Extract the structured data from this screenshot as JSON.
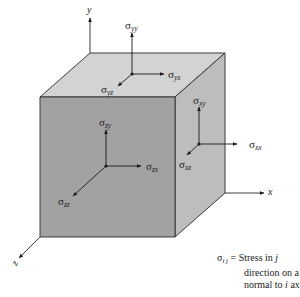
{
  "diagram": {
    "type": "3d-stress-element-cube",
    "colors": {
      "top_face": "#d3d3d3",
      "front_face": "#a2a2a2",
      "right_face": "#bdbdbd",
      "edge": "#2a2a2a",
      "arrow": "#1a1a1a"
    },
    "axes": {
      "x": {
        "label": "x"
      },
      "y": {
        "label": "y"
      },
      "z": {
        "label": "z"
      }
    },
    "faces": {
      "top": {
        "normal_axis": "y",
        "stresses": [
          {
            "symbol": "σ",
            "sub": "yy",
            "direction": "up"
          },
          {
            "symbol": "σ",
            "sub": "yx",
            "direction": "right"
          },
          {
            "symbol": "σ",
            "sub": "yz",
            "direction": "down-left"
          }
        ]
      },
      "front": {
        "normal_axis": "z",
        "stresses": [
          {
            "symbol": "σ",
            "sub": "zy",
            "direction": "up"
          },
          {
            "symbol": "σ",
            "sub": "zx",
            "direction": "right"
          },
          {
            "symbol": "σ",
            "sub": "zz",
            "direction": "down-left"
          }
        ]
      },
      "right": {
        "normal_axis": "x",
        "stresses": [
          {
            "symbol": "σ",
            "sub": "xy",
            "direction": "up"
          },
          {
            "symbol": "σ",
            "sub": "xx",
            "direction": "right"
          },
          {
            "symbol": "σ",
            "sub": "xz",
            "direction": "down-left"
          }
        ]
      }
    },
    "legend": {
      "symbol": "σ",
      "sub": "i j",
      "equals": "=",
      "line1_text": "Stress in ",
      "line1_var": "j",
      "line2": "direction on a face",
      "line3_text": "normal to ",
      "line3_var": "i",
      "line3_end": " axis"
    }
  }
}
